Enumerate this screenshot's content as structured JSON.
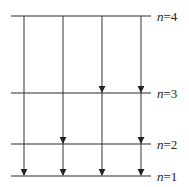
{
  "diagram": {
    "type": "energy-level-transitions",
    "levels": [
      {
        "n": 4,
        "label_var": "n",
        "label_eq": "=4"
      },
      {
        "n": 3,
        "label_var": "n",
        "label_eq": "=3"
      },
      {
        "n": 2,
        "label_var": "n",
        "label_eq": "=2"
      },
      {
        "n": 1,
        "label_var": "n",
        "label_eq": "=1"
      }
    ],
    "columns": [
      {
        "from": 4,
        "arrows_at": [
          1
        ]
      },
      {
        "from": 4,
        "arrows_at": [
          2,
          1
        ]
      },
      {
        "from": 4,
        "arrows_at": [
          3,
          1
        ]
      },
      {
        "from": 4,
        "arrows_at": [
          3,
          2,
          1
        ]
      }
    ],
    "colors": {
      "line": "#2a2a2a",
      "text": "#222222",
      "background": "#ffffff"
    }
  }
}
